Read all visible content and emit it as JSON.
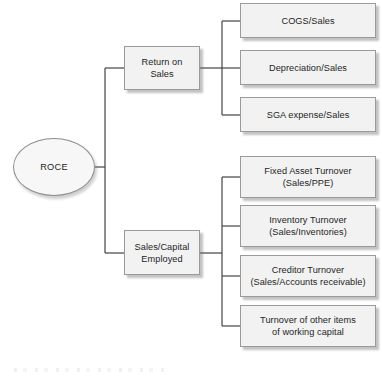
{
  "diagram": {
    "type": "tree",
    "root": {
      "label": "ROCE",
      "shape": "ellipse"
    },
    "branches": [
      {
        "label": "Return on\nSales",
        "label_line1": "Return on",
        "label_line2": "Sales",
        "children": [
          {
            "line1": "COGS/Sales",
            "line2": ""
          },
          {
            "line1": "Depreciation/Sales",
            "line2": ""
          },
          {
            "line1": "SGA expense/Sales",
            "line2": ""
          }
        ]
      },
      {
        "label": "Sales/Capital\nEmployed",
        "label_line1": "Sales/Capital",
        "label_line2": "Employed",
        "children": [
          {
            "line1": "Fixed Asset Turnover",
            "line2": "(Sales/PPE)"
          },
          {
            "line1": "Inventory Turnover",
            "line2": "(Sales/Inventories)"
          },
          {
            "line1": "Creditor Turnover",
            "line2": "(Sales/Accounts receivable)"
          },
          {
            "line1": "Turnover of other items",
            "line2": "of working capital"
          }
        ]
      }
    ],
    "colors": {
      "box_fill": "#f2f2f2",
      "box_border": "#9a9a9a",
      "connector": "#4a4a4a",
      "text": "#1e1e1e",
      "background": "#ffffff"
    }
  }
}
